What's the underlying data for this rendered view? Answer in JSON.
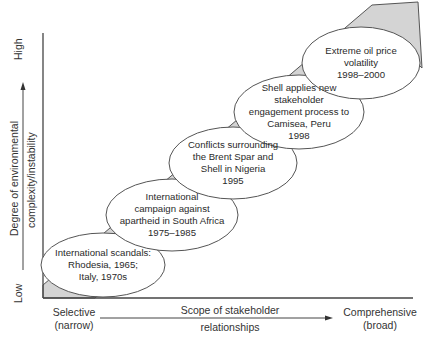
{
  "diagram": {
    "y_axis": {
      "label_line1": "Degree of environmental",
      "label_line2": "complexity/instability",
      "low_label": "Low",
      "high_label": "High"
    },
    "x_axis": {
      "label_line1": "Scope of stakeholder",
      "label_line2": "relationships",
      "left_label_line1": "Selective",
      "left_label_line2": "(narrow)",
      "right_label_line1": "Comprehensive",
      "right_label_line2": "(broad)"
    },
    "colors": {
      "band_fill": "#d4d4d4",
      "stroke": "#555555",
      "ellipse_fill": "#ffffff"
    },
    "events": [
      {
        "lines": [
          "International scandals:",
          "Rhodesia, 1965;",
          "Italy, 1970s"
        ]
      },
      {
        "lines": [
          "International",
          "campaign against",
          "apartheid in South Africa",
          "1975–1985"
        ]
      },
      {
        "lines": [
          "Conflicts surrounding",
          "the Brent Spar and",
          "Shell in Nigeria",
          "1995"
        ]
      },
      {
        "lines": [
          "Shell applies new",
          "stakeholder",
          "engagement process to",
          "Camisea, Peru",
          "1998"
        ]
      },
      {
        "lines": [
          "Extreme oil price",
          "volatility",
          "1998–2000"
        ]
      }
    ]
  }
}
